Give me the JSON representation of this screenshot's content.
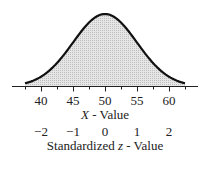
{
  "chart_data": {
    "type": "area",
    "title": "",
    "mean": 50,
    "sd": 5,
    "x_axis": {
      "label_prefix": "X",
      "label_suffix": " - Value",
      "ticks": [
        40,
        45,
        50,
        55,
        60
      ],
      "range": [
        37.5,
        62.5
      ]
    },
    "z_axis": {
      "label_prefix": "Standardized ",
      "label_var": "z",
      "label_suffix": " - Value",
      "ticks": [
        "-2",
        "-1",
        "0",
        "1",
        "2"
      ]
    },
    "grid": false,
    "fill_color": "#d8d8d8",
    "line_color": "#111111"
  }
}
